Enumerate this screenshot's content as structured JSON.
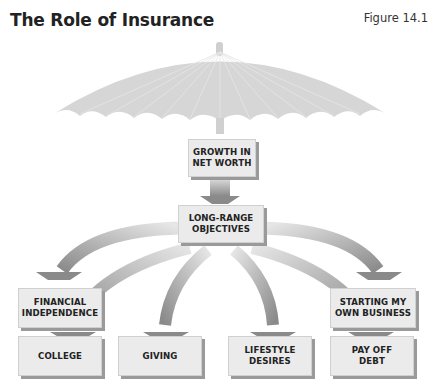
{
  "title": "The Role of Insurance",
  "figure_label": "Figure 14.1",
  "colors": {
    "umbrella": "#d6d6d6",
    "box_fill": "#ebebeb",
    "box_shadow": "#9a9a9a",
    "arrow_dark": "#8c8c8c",
    "arrow_light": "#e4e4e4"
  },
  "nodes": {
    "top": {
      "line1": "GROWTH IN",
      "line2": "NET WORTH"
    },
    "middle": {
      "line1": "LONG-RANGE",
      "line2": "OBJECTIVES"
    },
    "financial_independence": {
      "line1": "FINANCIAL",
      "line2": "INDEPENDENCE"
    },
    "starting_business": {
      "line1": "STARTING MY",
      "line2": "OWN BUSINESS"
    },
    "college": {
      "line1": "COLLEGE"
    },
    "giving": {
      "line1": "GIVING"
    },
    "lifestyle_desires": {
      "line1": "LIFESTYLE",
      "line2": "DESIRES"
    },
    "pay_off_debt": {
      "line1": "PAY OFF",
      "line2": "DEBT"
    }
  },
  "edges": [
    [
      "top",
      "middle"
    ],
    [
      "middle",
      "financial_independence"
    ],
    [
      "middle",
      "starting_business"
    ],
    [
      "middle",
      "college"
    ],
    [
      "middle",
      "giving"
    ],
    [
      "middle",
      "lifestyle_desires"
    ],
    [
      "middle",
      "pay_off_debt"
    ]
  ]
}
